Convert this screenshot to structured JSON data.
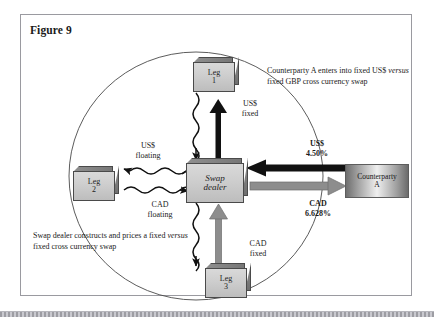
{
  "figure": {
    "title": "Figure 9"
  },
  "nodes": {
    "leg1": {
      "line1": "Leg",
      "line2": "1"
    },
    "leg2": {
      "line1": "Leg",
      "line2": "2"
    },
    "leg3": {
      "line1": "Leg",
      "line2": "3"
    },
    "dealer": {
      "line1": "Swap",
      "line2": "dealer"
    },
    "counterparty": {
      "line1": "Counterparty",
      "line2": "A"
    }
  },
  "annotations": {
    "counterparty_note": {
      "part1": "Counterparty A enters into fixed US$ ",
      "italic": "versus",
      "part2": " fixed GBP cross currency swap"
    },
    "dealer_note": {
      "part1": "Swap dealer constructs and prices a fixed ",
      "italic": "versus",
      "part2": " fixed cross currency swap"
    }
  },
  "flow_labels": {
    "usd_fixed": {
      "line1": "US$",
      "line2": "fixed"
    },
    "usd_floating": {
      "line1": "US$",
      "line2": "floating"
    },
    "cad_floating": {
      "line1": "CAD",
      "line2": "floating"
    },
    "cad_fixed": {
      "line1": "CAD",
      "line2": "fixed"
    },
    "usd_rate": {
      "line1": "US$",
      "line2": "4.50%"
    },
    "cad_rate": {
      "line1": "CAD",
      "line2": "6.628%"
    }
  },
  "colors": {
    "frame_border": "#9a9aa0",
    "black_arrow": "#111111",
    "gray_arrow": "#8d8d8d",
    "box_fill": "#cfcfcf",
    "ellipse_stroke": "#4a4a4a"
  }
}
